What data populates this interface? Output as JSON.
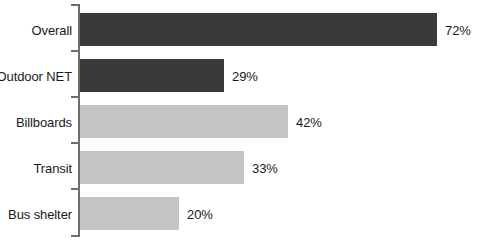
{
  "chart_data": {
    "type": "bar",
    "orientation": "horizontal",
    "title": "",
    "subtitle": "",
    "xlabel": "",
    "ylabel": "",
    "xlim": [
      0,
      72
    ],
    "grid": false,
    "legend": "none",
    "unit": "%",
    "categories": [
      "Overall",
      "Outdoor NET",
      "Billboards",
      "Transit",
      "Bus shelter"
    ],
    "values": [
      72,
      29,
      42,
      33,
      20
    ],
    "value_labels": [
      "72%",
      "29%",
      "42%",
      "33%",
      "20%"
    ],
    "colors": [
      "#3a3a3a",
      "#3a3a3a",
      "#c4c4c4",
      "#c4c4c4",
      "#c4c4c4"
    ],
    "series": [
      {
        "name": "",
        "values": [
          72,
          29,
          42,
          33,
          20
        ]
      }
    ],
    "bars": [
      {
        "label": "Overall",
        "value": 72,
        "value_label": "72%",
        "color": "#3a3a3a"
      },
      {
        "label": "Outdoor NET",
        "value": 29,
        "value_label": "29%",
        "color": "#3a3a3a"
      },
      {
        "label": "Billboards",
        "value": 42,
        "value_label": "42%",
        "color": "#c4c4c4"
      },
      {
        "label": "Transit",
        "value": 33,
        "value_label": "33%",
        "color": "#c4c4c4"
      },
      {
        "label": "Bus shelter",
        "value": 20,
        "value_label": "20%",
        "color": "#c4c4c4"
      }
    ]
  },
  "style": {
    "axis_color": "#6e6e6e",
    "text_color": "#1a1a1a",
    "background": "#ffffff",
    "dark_bar_color": "#3a3a3a",
    "light_bar_color": "#c4c4c4"
  }
}
